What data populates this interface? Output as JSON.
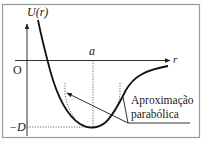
{
  "figure": {
    "y_axis_label": "U(r)",
    "x_axis_label": "r",
    "origin_label": "O",
    "equilibrium_label": "a",
    "depth_label": "−D",
    "annotation_line1": "Aproximação",
    "annotation_line2": "parabólica"
  },
  "colors": {
    "frame": "#9a9a9a",
    "ink": "#1a1a1a"
  }
}
